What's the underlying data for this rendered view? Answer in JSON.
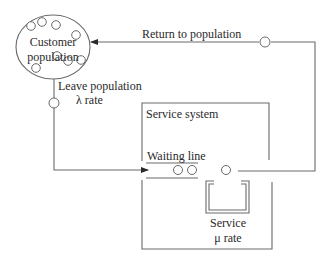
{
  "diagram": {
    "type": "queueing-system",
    "colors": {
      "line": "#6a6a6a",
      "text": "#2a2a2a",
      "background": "#ffffff"
    },
    "customer_population": {
      "line1": "Customer",
      "line2": "population"
    },
    "return_label": "Return to population",
    "leave_label": {
      "line1": "Leave population",
      "line2": "λ rate"
    },
    "service_system_label": "Service system",
    "waiting_line_label": "Waiting line",
    "service_label": {
      "line1": "Service",
      "line2": "μ rate"
    }
  }
}
